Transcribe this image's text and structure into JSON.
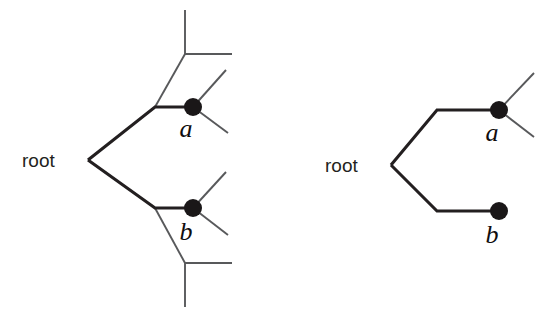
{
  "figure": {
    "background_color": "#ffffff",
    "width": 544,
    "height": 317,
    "thick_edge_color": "#231f20",
    "thin_edge_color": "#58595b",
    "node_color": "#1a1718",
    "label_color": "#231f20"
  },
  "left_tree": {
    "name": "left-tree",
    "description": "Rooted tree with interior structure: root splits to upper and lower paths, each leading through a junction to a filled node labelled a or b, with additional unlabelled branches",
    "root_label": "root",
    "leaf_labels": [
      "a",
      "b"
    ],
    "node_a_label": "a",
    "node_b_label": "b",
    "root_vertex": {
      "x": 88,
      "y": 160
    },
    "node_a": {
      "x": 193,
      "y": 107,
      "r": 9
    },
    "node_b": {
      "x": 193,
      "y": 208,
      "r": 9
    },
    "root_text_pos": {
      "x": 22,
      "y": 167
    },
    "a_text_pos": {
      "x": 186,
      "y": 137
    },
    "b_text_pos": {
      "x": 186,
      "y": 240
    },
    "edges_thick": [
      {
        "name": "root-to-upper-junction",
        "points": "88,160 155,107 193,107"
      },
      {
        "name": "root-to-lower-junction",
        "points": "88,160 155,208 193,208"
      }
    ],
    "edges_thin": [
      {
        "name": "upper-junction-to-top-corner",
        "points": "155,107 185,54"
      },
      {
        "name": "top-corner-vertical-up",
        "points": "185,54 185,10"
      },
      {
        "name": "top-corner-horizontal-right",
        "points": "185,54 232,54"
      },
      {
        "name": "node-a-up-right",
        "points": "193,107 226,70"
      },
      {
        "name": "node-a-down-right",
        "points": "193,107 228,133"
      },
      {
        "name": "lower-junction-to-bottom-corner",
        "points": "155,208 185,263"
      },
      {
        "name": "bottom-corner-vertical-down",
        "points": "185,263 185,307"
      },
      {
        "name": "bottom-corner-horizontal-right",
        "points": "185,263 232,263"
      },
      {
        "name": "node-b-up-right",
        "points": "193,208 226,172"
      },
      {
        "name": "node-b-down-right",
        "points": "193,208 228,235"
      }
    ]
  },
  "right_tree": {
    "name": "right-tree",
    "description": "Simplified rooted tree: root splits to node a (with two extra branches) and node b (a terminal leaf)",
    "root_label": "root",
    "leaf_labels": [
      "a",
      "b"
    ],
    "node_a_label": "a",
    "node_b_label": "b",
    "root_vertex": {
      "x": 391,
      "y": 165
    },
    "node_a": {
      "x": 499,
      "y": 110,
      "r": 9
    },
    "node_b": {
      "x": 499,
      "y": 211,
      "r": 9
    },
    "root_text_pos": {
      "x": 325,
      "y": 172
    },
    "a_text_pos": {
      "x": 492,
      "y": 141
    },
    "b_text_pos": {
      "x": 492,
      "y": 243
    },
    "edges_thick": [
      {
        "name": "root-to-node-a",
        "points": "391,165 437,110 499,110"
      },
      {
        "name": "root-to-node-b",
        "points": "391,165 437,211 499,211"
      }
    ],
    "edges_thin": [
      {
        "name": "node-a-up-right",
        "points": "499,110 534,73"
      },
      {
        "name": "node-a-down-right",
        "points": "499,110 534,137"
      }
    ]
  }
}
